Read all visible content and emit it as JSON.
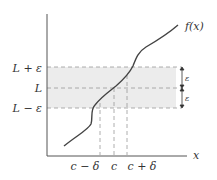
{
  "diagram": {
    "curve_label": "f(x)",
    "x_axis_label": "x",
    "y_labels": {
      "upper": "L + ε",
      "mid": "L",
      "lower": "L − ε"
    },
    "x_labels": {
      "left": "c − δ",
      "mid": "c",
      "right": "c + δ"
    },
    "epsilon_labels": [
      "ε",
      "ε"
    ],
    "colors": {
      "band": "#ececec",
      "line": "#444444",
      "dash": "#999999"
    }
  }
}
